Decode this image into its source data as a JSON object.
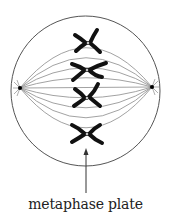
{
  "diagram": {
    "title": "Metaphase",
    "label": "metaphase plate",
    "colors": {
      "background": "#ffffff",
      "cell_outline": "#555555",
      "spindle": "#8a8a8a",
      "chromosome": "#111111",
      "pole": "#000000",
      "label_text": "#222222"
    },
    "cell": {
      "cx": 85,
      "cy": 91,
      "rx": 75,
      "ry": 75
    },
    "poles": [
      {
        "name": "left-pole",
        "x": 20,
        "y": 88
      },
      {
        "name": "right-pole",
        "x": 152,
        "y": 87
      }
    ],
    "chromosomes": [
      {
        "name": "chromosome-1",
        "cx": 88,
        "cy": 43
      },
      {
        "name": "chromosome-2",
        "cx": 86,
        "cy": 70
      },
      {
        "name": "chromosome-3",
        "cx": 87,
        "cy": 97
      },
      {
        "name": "chromosome-4",
        "cx": 86,
        "cy": 134
      }
    ],
    "arrow": {
      "x": 86,
      "y_start": 193,
      "y_end": 149
    }
  }
}
